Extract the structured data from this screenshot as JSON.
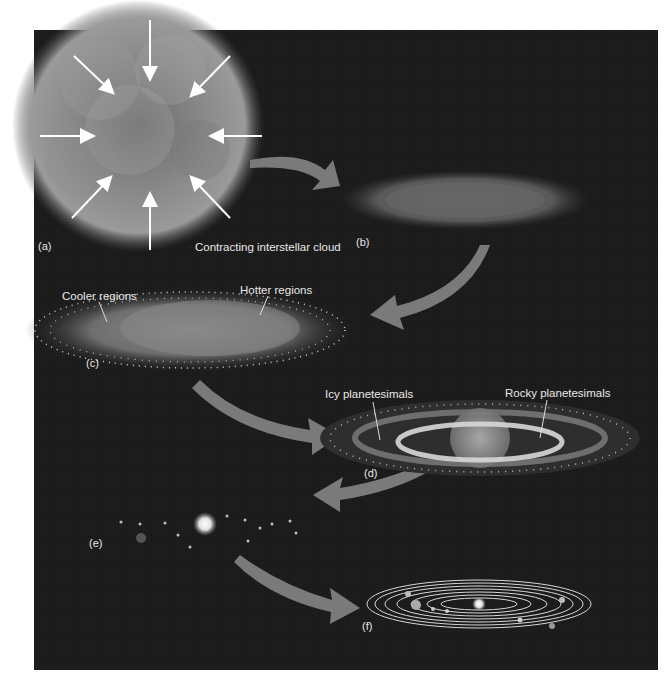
{
  "figure": {
    "stages": [
      {
        "id": "a",
        "tag": "(a)",
        "caption": "Contracting interstellar cloud"
      },
      {
        "id": "b",
        "tag": "(b)",
        "caption": ""
      },
      {
        "id": "c",
        "tag": "(c)",
        "annotations": [
          "Cooler regions",
          "Hotter regions"
        ]
      },
      {
        "id": "d",
        "tag": "(d)",
        "annotations": [
          "Icy planetesimals",
          "Rocky planetesimals"
        ]
      },
      {
        "id": "e",
        "tag": "(e)"
      },
      {
        "id": "f",
        "tag": "(f)"
      }
    ],
    "colors": {
      "background": "#1b1b1b",
      "arrow": "#7a7a7a",
      "text": "#e8e8e8",
      "page": "#ffffff"
    }
  }
}
